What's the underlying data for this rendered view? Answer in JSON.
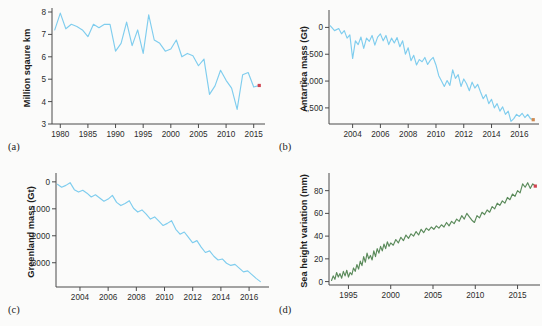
{
  "figure": {
    "background_color": "#fbfbfa",
    "line_color_blue": "#7fcdee",
    "line_color_green": "#5a8a5a",
    "endpoint_marker_color": "#d0434f"
  },
  "panels": [
    {
      "key": "a",
      "label": "(a)"
    },
    {
      "key": "b",
      "label": "(b)"
    },
    {
      "key": "c",
      "label": "(c)"
    },
    {
      "key": "d",
      "label": "(d)"
    }
  ],
  "chart_data": [
    {
      "panel": "a",
      "type": "line",
      "title": "",
      "xlabel": "",
      "ylabel": "Million sqaure km",
      "color": "#7fcdee",
      "grid": false,
      "legend": "none",
      "xlim": [
        1978.5,
        2016.5
      ],
      "ylim": [
        3,
        8
      ],
      "yticks": [
        3,
        4,
        5,
        6,
        7,
        8
      ],
      "ytick_labels": [
        "3",
        "4",
        "5",
        "6",
        "7",
        "8"
      ],
      "xticks": [
        1980,
        1985,
        1990,
        1995,
        2000,
        2005,
        2010,
        2015
      ],
      "xtick_labels": [
        "1980",
        "1985",
        "1990",
        "1995",
        "2000",
        "2005",
        "2010",
        "2015"
      ],
      "endpoint_marker": {
        "x": 2016,
        "y": 4.72,
        "color": "#d0434f"
      },
      "x": [
        1979,
        1980,
        1981,
        1982,
        1983,
        1984,
        1985,
        1986,
        1987,
        1988,
        1989,
        1990,
        1991,
        1992,
        1993,
        1994,
        1995,
        1996,
        1997,
        1998,
        1999,
        2000,
        2001,
        2002,
        2003,
        2004,
        2005,
        2006,
        2007,
        2008,
        2009,
        2010,
        2011,
        2012,
        2013,
        2014,
        2015,
        2016
      ],
      "values": [
        7.2,
        7.95,
        7.25,
        7.45,
        7.35,
        7.2,
        6.9,
        7.45,
        7.3,
        7.45,
        7.45,
        6.25,
        6.6,
        7.55,
        6.5,
        7.2,
        6.15,
        7.87,
        6.75,
        6.6,
        6.25,
        6.35,
        6.75,
        6.0,
        6.15,
        6.05,
        5.6,
        5.9,
        4.32,
        4.7,
        5.4,
        4.95,
        4.6,
        3.65,
        5.2,
        5.3,
        4.65,
        4.72
      ]
    },
    {
      "panel": "b",
      "type": "line",
      "title": "",
      "xlabel": "",
      "ylabel": "Antartica mass (Gt)",
      "color": "#7fcdee",
      "grid": false,
      "legend": "none",
      "xlim": [
        2002.3,
        2017.2
      ],
      "ylim": [
        -1800,
        250
      ],
      "yticks": [
        0,
        -500,
        -1000,
        -1500
      ],
      "ytick_labels": [
        "0",
        "-500",
        "-1,000",
        "-1,500"
      ],
      "xticks": [
        2004,
        2006,
        2008,
        2010,
        2012,
        2014,
        2016
      ],
      "xtick_labels": [
        "2004",
        "2006",
        "2008",
        "2010",
        "2012",
        "2014",
        "2016"
      ],
      "endpoint_marker": {
        "x": 2017,
        "y": -1720,
        "color": "#d0894f"
      },
      "x": [
        2002.4,
        2002.7,
        2003.0,
        2003.2,
        2003.4,
        2003.6,
        2003.8,
        2004.0,
        2004.2,
        2004.4,
        2004.6,
        2004.8,
        2005.0,
        2005.2,
        2005.4,
        2005.6,
        2005.8,
        2006.0,
        2006.2,
        2006.4,
        2006.6,
        2006.8,
        2007.0,
        2007.2,
        2007.4,
        2007.6,
        2007.8,
        2008.0,
        2008.2,
        2008.4,
        2008.6,
        2008.8,
        2009.0,
        2009.2,
        2009.4,
        2009.6,
        2009.8,
        2010.0,
        2010.2,
        2010.4,
        2010.6,
        2010.8,
        2011.0,
        2011.2,
        2011.4,
        2011.6,
        2011.8,
        2012.0,
        2012.2,
        2012.4,
        2012.6,
        2012.8,
        2013.0,
        2013.2,
        2013.4,
        2013.6,
        2013.8,
        2014.0,
        2014.2,
        2014.4,
        2014.6,
        2014.8,
        2015.0,
        2015.2,
        2015.4,
        2015.6,
        2015.8,
        2016.0,
        2016.2,
        2016.4,
        2016.6,
        2016.8,
        2017.0
      ],
      "values": [
        30,
        -60,
        -20,
        -120,
        -60,
        -200,
        -140,
        -580,
        -250,
        -320,
        -180,
        -390,
        -200,
        -260,
        -150,
        -330,
        -180,
        -120,
        -250,
        -150,
        -320,
        -200,
        -290,
        -190,
        -360,
        -250,
        -500,
        -380,
        -620,
        -520,
        -700,
        -600,
        -640,
        -560,
        -690,
        -610,
        -560,
        -700,
        -900,
        -1000,
        -1100,
        -990,
        -1080,
        -790,
        -950,
        -880,
        -1100,
        -960,
        -1050,
        -1180,
        -1020,
        -1130,
        -1060,
        -1200,
        -1330,
        -1250,
        -1420,
        -1340,
        -1500,
        -1420,
        -1560,
        -1480,
        -1620,
        -1560,
        -1750,
        -1700,
        -1620,
        -1660,
        -1600,
        -1680,
        -1620,
        -1700,
        -1720
      ]
    },
    {
      "panel": "c",
      "type": "line",
      "title": "",
      "xlabel": "",
      "ylabel": "Greenland mass (Gt)",
      "color": "#7fcdee",
      "grid": false,
      "legend": "none",
      "xlim": [
        2002.3,
        2017.2
      ],
      "ylim": [
        -3900,
        180
      ],
      "yticks": [
        0,
        -1000,
        -2000,
        -3000
      ],
      "ytick_labels": [
        "0",
        "-1000",
        "-2000",
        "-3000"
      ],
      "xticks": [
        2004,
        2006,
        2008,
        2010,
        2012,
        2014,
        2016
      ],
      "xtick_labels": [
        "2004",
        "2006",
        "2008",
        "2010",
        "2012",
        "2014",
        "2016"
      ],
      "endpoint_marker": null,
      "x": [
        2002.4,
        2002.7,
        2003.0,
        2003.3,
        2003.6,
        2003.9,
        2004.2,
        2004.5,
        2004.8,
        2005.1,
        2005.4,
        2005.7,
        2006.0,
        2006.3,
        2006.6,
        2006.9,
        2007.2,
        2007.5,
        2007.8,
        2008.1,
        2008.4,
        2008.7,
        2009.0,
        2009.3,
        2009.6,
        2009.9,
        2010.2,
        2010.5,
        2010.8,
        2011.1,
        2011.4,
        2011.7,
        2012.0,
        2012.3,
        2012.6,
        2012.9,
        2013.2,
        2013.5,
        2013.8,
        2014.1,
        2014.4,
        2014.7,
        2015.0,
        2015.3,
        2015.6,
        2015.9,
        2016.2,
        2016.5,
        2016.8
      ],
      "values": [
        -90,
        -200,
        -130,
        -30,
        -290,
        -380,
        -310,
        -420,
        -560,
        -480,
        -600,
        -720,
        -640,
        -500,
        -760,
        -880,
        -800,
        -700,
        -980,
        -1120,
        -1040,
        -1200,
        -1380,
        -1300,
        -1460,
        -1620,
        -1540,
        -1440,
        -1760,
        -1940,
        -1860,
        -2060,
        -2260,
        -2180,
        -2420,
        -2620,
        -2560,
        -2760,
        -2900,
        -2860,
        -3020,
        -3100,
        -3060,
        -3200,
        -3340,
        -3300,
        -3440,
        -3580,
        -3700
      ]
    },
    {
      "panel": "d",
      "type": "line",
      "title": "",
      "xlabel": "",
      "ylabel": "Sea height variation (mm)",
      "color": "#5a8a5a",
      "grid": false,
      "legend": "none",
      "xlim": [
        1992.7,
        2017.3
      ],
      "ylim": [
        -3,
        92
      ],
      "yticks": [
        0,
        20,
        40,
        60,
        80
      ],
      "ytick_labels": [
        "0",
        "20",
        "40",
        "60",
        "80"
      ],
      "xticks": [
        1995,
        2000,
        2005,
        2010,
        2015
      ],
      "xtick_labels": [
        "1995",
        "2000",
        "2005",
        "2010",
        "2015"
      ],
      "endpoint_marker": {
        "x": 2017.1,
        "y": 84,
        "color": "#d0434f"
      },
      "x": [
        1993.0,
        1993.2,
        1993.4,
        1993.6,
        1993.8,
        1994.0,
        1994.2,
        1994.4,
        1994.6,
        1994.8,
        1995.0,
        1995.2,
        1995.4,
        1995.6,
        1995.8,
        1996.0,
        1996.2,
        1996.4,
        1996.6,
        1996.8,
        1997.0,
        1997.2,
        1997.4,
        1997.6,
        1997.8,
        1998.0,
        1998.2,
        1998.4,
        1998.6,
        1998.8,
        1999.0,
        1999.2,
        1999.4,
        1999.6,
        1999.8,
        2000.0,
        2000.3,
        2000.6,
        2000.9,
        2001.2,
        2001.5,
        2001.8,
        2002.1,
        2002.4,
        2002.7,
        2003.0,
        2003.3,
        2003.6,
        2003.9,
        2004.2,
        2004.5,
        2004.8,
        2005.1,
        2005.4,
        2005.7,
        2006.0,
        2006.3,
        2006.6,
        2006.9,
        2007.2,
        2007.5,
        2007.8,
        2008.1,
        2008.4,
        2008.7,
        2009.0,
        2009.3,
        2009.6,
        2009.9,
        2010.2,
        2010.5,
        2010.8,
        2011.1,
        2011.4,
        2011.7,
        2012.0,
        2012.3,
        2012.6,
        2012.9,
        2013.2,
        2013.5,
        2013.8,
        2014.1,
        2014.4,
        2014.7,
        2015.0,
        2015.3,
        2015.6,
        2015.9,
        2016.2,
        2016.5,
        2016.8,
        2017.1
      ],
      "values": [
        1,
        5,
        2,
        8,
        4,
        7,
        3,
        9,
        5,
        10,
        4,
        8,
        6,
        12,
        9,
        15,
        11,
        18,
        14,
        22,
        17,
        25,
        20,
        23,
        19,
        27,
        22,
        29,
        25,
        31,
        27,
        33,
        29,
        35,
        31,
        34,
        32,
        37,
        34,
        39,
        36,
        41,
        38,
        42,
        40,
        44,
        41,
        46,
        43,
        47,
        45,
        48,
        46,
        49,
        47,
        50,
        48,
        52,
        49,
        53,
        51,
        55,
        53,
        58,
        55,
        60,
        57,
        54,
        52,
        58,
        56,
        61,
        59,
        63,
        61,
        66,
        64,
        69,
        67,
        71,
        69,
        74,
        72,
        77,
        75,
        80,
        78,
        86,
        83,
        87,
        82,
        86,
        84
      ]
    }
  ]
}
